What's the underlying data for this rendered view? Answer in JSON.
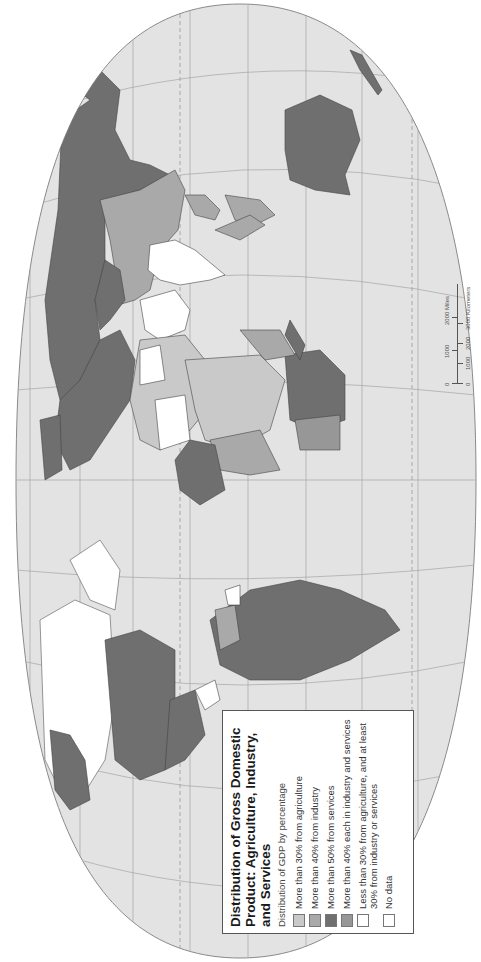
{
  "figure": {
    "orientation": "rotated-90-ccw",
    "title": "Distribution of Gross Domestic Product: Agriculture, Industry, and Services",
    "title_lines": [
      "Distribution of Gross Domestic",
      "Product: Agriculture, Industry,",
      "and Services"
    ],
    "subtitle": "Distribution of GDP by percentage"
  },
  "legend": {
    "items": [
      {
        "label": "More than 30% from agriculture",
        "color": "#c9c9c9"
      },
      {
        "label": "More than 40% from industry",
        "color": "#a9a9a9"
      },
      {
        "label": "More than 50% from services",
        "color": "#6f6f6f"
      },
      {
        "label": "More than 40% each in industry and services",
        "color": "#979797"
      },
      {
        "label": "Less than 30% from agriculture, and at least 30% from industry or services",
        "color": "#ffffff"
      },
      {
        "label": "No data",
        "color": "#ffffff"
      }
    ]
  },
  "scale_bar": {
    "miles": [
      "0",
      "1000",
      "2000 Miles"
    ],
    "kilometers": [
      "0",
      "1000",
      "2000",
      "3000 Kilometers"
    ]
  },
  "colors": {
    "ocean": "#e3e3e3",
    "background": "#ffffff",
    "graticule": "#9a9a9a",
    "border": "#4a4a4a"
  }
}
